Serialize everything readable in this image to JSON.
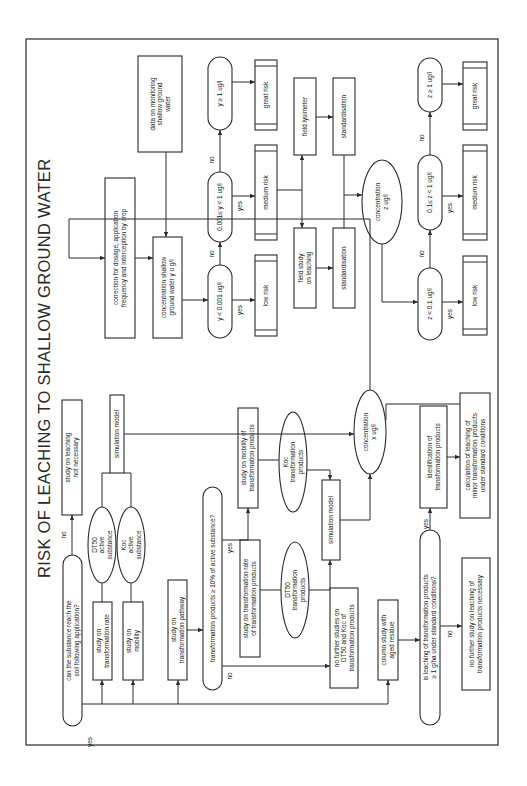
{
  "title": "RISK OF LEACHING TO SHALLOW GROUND WATER",
  "orientation": "rotated 90° counter-clockwise",
  "nodes": {
    "q_reach_soil": [
      "can the substance reach the",
      "soil following application?"
    ],
    "no_leach_study": [
      "study on leaching",
      "not necessary"
    ],
    "study_transf_rate": [
      "study on",
      "transformation rate"
    ],
    "study_mobility": [
      "study on",
      "mobility"
    ],
    "dt50_active": [
      "DT50",
      "active",
      "substance"
    ],
    "koc_active": [
      "Koc",
      "active",
      "substance"
    ],
    "sim_model_1": [
      "simulation model"
    ],
    "study_pathway": [
      "study on",
      "transformation pathway"
    ],
    "q_tp_10": [
      "transformation products ≥ 10% of active substance?"
    ],
    "study_rate_tp": [
      "study on transformation rate",
      "of transformation products"
    ],
    "study_mob_tp": [
      "study on mobility of",
      "transformation products"
    ],
    "dt50_tp": [
      "DT50",
      "transformation",
      "products"
    ],
    "koc_tp": [
      "Koc",
      "transformation",
      "products"
    ],
    "sim_model_2": [
      "simulation model"
    ],
    "no_further_dt50": [
      "no further studies on",
      "DT50 and Koc of",
      "transformation products"
    ],
    "column_study": [
      "column study with",
      "aged residue"
    ],
    "conc_x": [
      "concentration",
      "x ug/l"
    ],
    "q_leach_1gha": [
      "is leaching of transformation products",
      "≥ 1 g/ha under standard conditions?"
    ],
    "identification": [
      "identification of",
      "transformation products"
    ],
    "calc_leaching": [
      "calculation of leaching of",
      "minor transformation products",
      "under standard conditions"
    ],
    "no_further_leach": [
      "no further study on leaching of",
      "transformation products necessary"
    ],
    "correction": [
      "correction for dosage, application",
      "frequency and interception by crop"
    ],
    "conc_y": [
      "concentration shallow",
      "ground water y u g/l"
    ],
    "monitoring": [
      "data on monitoring",
      "shallow ground",
      "water"
    ],
    "y_low": [
      "y < 0.001 ug/l"
    ],
    "y_mid": [
      "0.001≤ y < 1 ug/l"
    ],
    "y_high": [
      "y ≥ 1 ug/l"
    ],
    "risk_low_y": [
      "low risk"
    ],
    "risk_med_y": [
      "medium risk"
    ],
    "risk_great_y": [
      "great risk"
    ],
    "field_study": [
      "field study",
      "on leaching"
    ],
    "field_lysimeter": [
      "field lysimeter"
    ],
    "std_1": [
      "standardisation"
    ],
    "std_2": [
      "standardisation"
    ],
    "conc_z": [
      "concentration",
      "z ug/l"
    ],
    "z_low": [
      "z < 0.1 ug/l"
    ],
    "z_mid": [
      "0.1≤ z < 1 ug/l"
    ],
    "z_high": [
      "z ≥ 1 ug/l"
    ],
    "risk_low_z": [
      "low risk"
    ],
    "risk_med_z": [
      "medium risk"
    ],
    "risk_great_z": [
      "great risk"
    ]
  },
  "edge_labels": {
    "yes": "yes",
    "no": "no"
  },
  "colors": {
    "line": "#2a2a2a",
    "background": "#ffffff"
  }
}
